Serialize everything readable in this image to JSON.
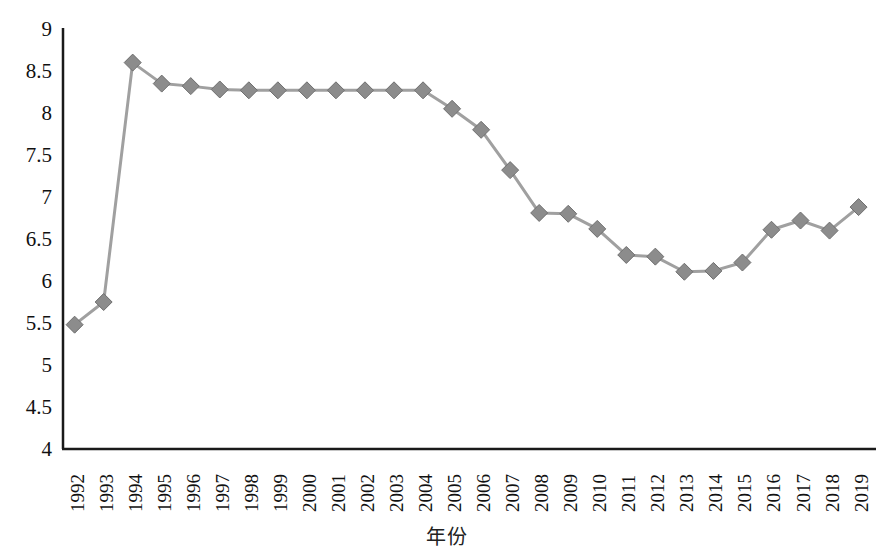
{
  "chart_data": {
    "type": "line",
    "title": "",
    "xlabel": "年份",
    "ylabel": "",
    "ylim": [
      4,
      9
    ],
    "ytick_step": 0.5,
    "grid": false,
    "legend": false,
    "marker": "diamond",
    "series_color": "#8c8c8c",
    "line_color": "#a0a0a0",
    "axis_color": "#1a1a1a",
    "categories": [
      "1992",
      "1993",
      "1994",
      "1995",
      "1996",
      "1997",
      "1998",
      "1999",
      "2000",
      "2001",
      "2002",
      "2003",
      "2004",
      "2005",
      "2006",
      "2007",
      "2008",
      "2009",
      "2010",
      "2011",
      "2012",
      "2013",
      "2014",
      "2015",
      "2016",
      "2017",
      "2018",
      "2019"
    ],
    "values": [
      5.48,
      5.75,
      8.6,
      8.35,
      8.32,
      8.28,
      8.27,
      8.27,
      8.27,
      8.27,
      8.27,
      8.27,
      8.27,
      8.05,
      7.8,
      7.32,
      6.81,
      6.8,
      6.62,
      6.31,
      6.29,
      6.11,
      6.12,
      6.22,
      6.61,
      6.72,
      6.6,
      6.88
    ],
    "ytick_labels": [
      "9",
      "8.5",
      "8",
      "7.5",
      "7",
      "6.5",
      "6",
      "5.5",
      "5",
      "4.5",
      "4"
    ],
    "ytick_values": [
      9,
      8.5,
      8,
      7.5,
      7,
      6.5,
      6,
      5.5,
      5,
      4.5,
      4
    ]
  }
}
